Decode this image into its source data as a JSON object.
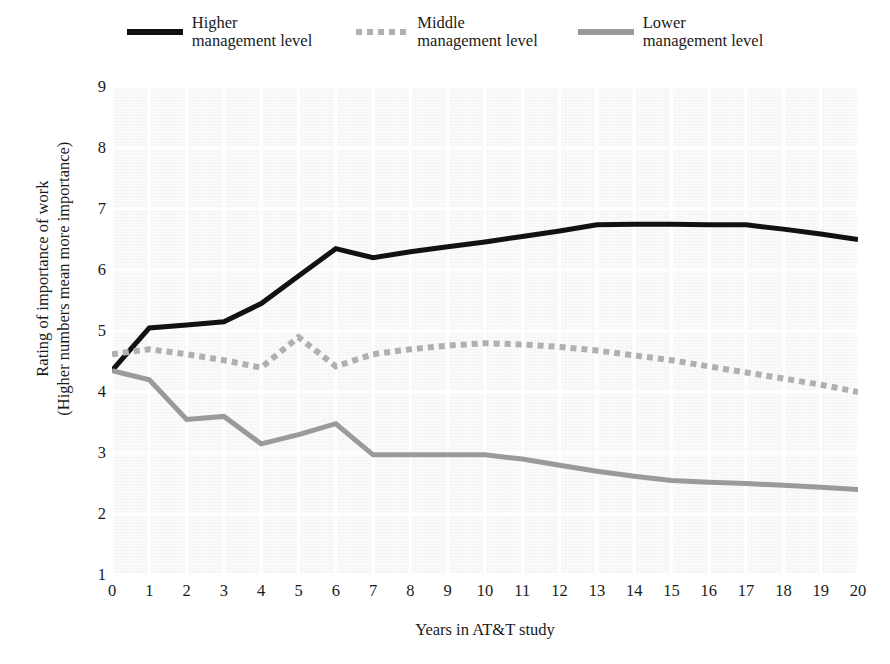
{
  "chart_data": {
    "type": "line",
    "title": "",
    "xlabel": "Years in AT&T study",
    "ylabel_line1": "Rating of importance of work",
    "ylabel_line2": "(Higher numbers mean more importance)",
    "x": [
      0,
      1,
      2,
      3,
      4,
      5,
      6,
      7,
      8,
      9,
      10,
      11,
      12,
      13,
      14,
      15,
      16,
      17,
      18,
      19,
      20
    ],
    "xlim": [
      0,
      20
    ],
    "ylim": [
      1,
      9
    ],
    "xticks": [
      "0",
      "1",
      "2",
      "3",
      "4",
      "5",
      "6",
      "7",
      "8",
      "9",
      "10",
      "11",
      "12",
      "13",
      "14",
      "15",
      "16",
      "17",
      "18",
      "19",
      "20"
    ],
    "yticks": [
      "1",
      "2",
      "3",
      "4",
      "5",
      "6",
      "7",
      "8",
      "9"
    ],
    "grid": true,
    "legend_position": "top-center",
    "series": [
      {
        "name": "Higher management level",
        "name_line1": "Higher",
        "name_line2": "management level",
        "style": "solid",
        "color": "#111111",
        "width": 5,
        "values": [
          4.35,
          5.05,
          5.1,
          5.15,
          5.45,
          5.9,
          6.35,
          6.2,
          6.3,
          6.38,
          6.46,
          6.55,
          6.64,
          6.74,
          6.75,
          6.75,
          6.74,
          6.74,
          6.67,
          6.59,
          6.5
        ]
      },
      {
        "name": "Middle management level",
        "name_line1": "Middle",
        "name_line2": "management level",
        "style": "dotted",
        "color": "#b0b0b0",
        "width": 6,
        "values": [
          4.62,
          4.7,
          4.62,
          4.52,
          4.4,
          4.9,
          4.42,
          4.62,
          4.7,
          4.76,
          4.8,
          4.78,
          4.74,
          4.68,
          4.6,
          4.52,
          4.42,
          4.32,
          4.22,
          4.12,
          4.0
        ]
      },
      {
        "name": "Lower management level",
        "name_line1": "Lower",
        "name_line2": "management level",
        "style": "solid",
        "color": "#9a9a9a",
        "width": 5,
        "values": [
          4.35,
          4.2,
          3.55,
          3.6,
          3.15,
          3.3,
          3.48,
          2.97,
          2.97,
          2.97,
          2.97,
          2.9,
          2.8,
          2.7,
          2.62,
          2.55,
          2.52,
          2.5,
          2.47,
          2.44,
          2.4
        ]
      }
    ]
  }
}
